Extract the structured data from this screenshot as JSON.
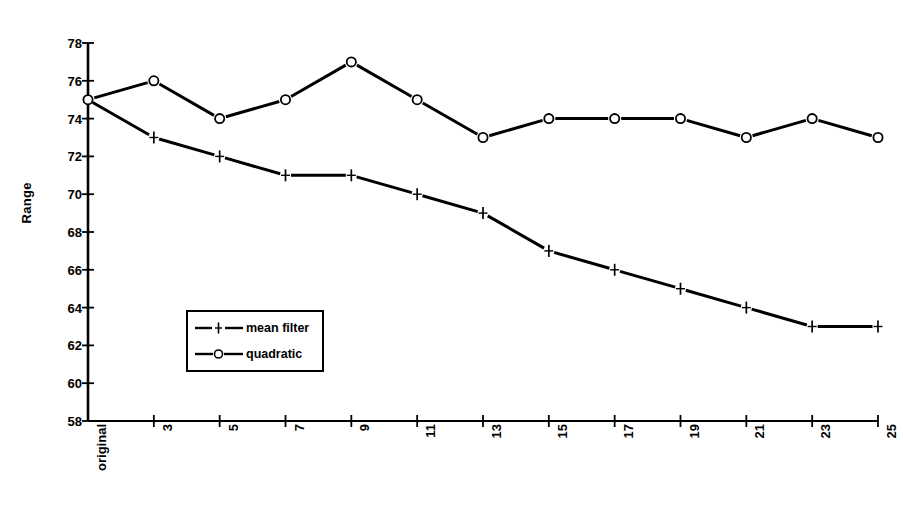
{
  "chart_data": {
    "type": "line",
    "title": "",
    "xlabel": "Window size",
    "ylabel": "Range",
    "categories": [
      "original",
      "3",
      "5",
      "7",
      "9",
      "11",
      "13",
      "15",
      "17",
      "19",
      "21",
      "23",
      "25"
    ],
    "ylim": [
      58,
      78
    ],
    "yticks": [
      78,
      76,
      74,
      72,
      70,
      68,
      66,
      64,
      62,
      60,
      58
    ],
    "grid": false,
    "legend_position": "center-left-inside",
    "series": [
      {
        "name": "mean filter",
        "marker": "plus",
        "values": [
          75,
          73,
          72,
          71,
          71,
          70,
          69,
          67,
          66,
          65,
          64,
          63,
          63
        ]
      },
      {
        "name": "quadratic",
        "marker": "circle",
        "values": [
          75,
          76,
          74,
          75,
          77,
          75,
          73,
          74,
          74,
          74,
          73,
          74,
          73
        ]
      }
    ],
    "colors": {
      "line": "#000000",
      "background": "#ffffff",
      "axis": "#000000"
    }
  },
  "legend": {
    "items": [
      {
        "label": "mean filter"
      },
      {
        "label": "quadratic"
      }
    ]
  },
  "axes": {
    "y_title": "Range",
    "x_title": "Window size"
  }
}
